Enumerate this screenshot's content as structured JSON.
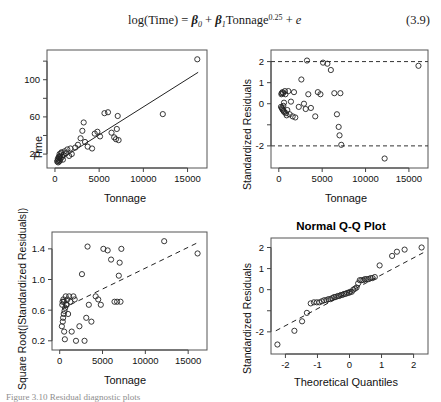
{
  "equation": {
    "number": "(3.9)",
    "text": "log(Time) = β₀ + β₁Tonnage^0.25 + e",
    "lhs": "log(Time) = ",
    "beta0": "β",
    "beta0_sub": "0",
    "plus1": " + ",
    "beta1": "β",
    "beta1_sub": "1",
    "term": "Tonnage",
    "exponent": "0.25",
    "plus2": " + ",
    "error": "e"
  },
  "caption_partial": "Figure 3.10  Residual diagnostic plots",
  "chart_data": [
    {
      "id": "time-vs-tonnage",
      "type": "scatter",
      "title": "",
      "xlabel": "Tonnage",
      "ylabel": "Time",
      "xlim": [
        -900,
        17200
      ],
      "ylim": [
        5,
        132
      ],
      "xticks": [
        0,
        5000,
        10000,
        15000
      ],
      "xticklabels": [
        "0",
        "5000",
        "10000",
        "15000"
      ],
      "yticks": [
        20,
        60,
        100
      ],
      "yticklabels": [
        "20",
        "60",
        "100"
      ],
      "yminorticks": [
        40,
        80,
        120
      ],
      "grid": false,
      "legend": "none",
      "marker": "open-circle",
      "fit_line": {
        "style": "solid",
        "x": [
          380,
          16200
        ],
        "y": [
          13,
          108
        ]
      },
      "points": [
        [
          250,
          12
        ],
        [
          300,
          13
        ],
        [
          330,
          15
        ],
        [
          360,
          11
        ],
        [
          400,
          14
        ],
        [
          430,
          17
        ],
        [
          470,
          12
        ],
        [
          500,
          16
        ],
        [
          520,
          20
        ],
        [
          560,
          13
        ],
        [
          600,
          18
        ],
        [
          640,
          15
        ],
        [
          700,
          21
        ],
        [
          760,
          22
        ],
        [
          820,
          17
        ],
        [
          900,
          14
        ],
        [
          980,
          19
        ],
        [
          1100,
          23
        ],
        [
          1250,
          21
        ],
        [
          1400,
          25
        ],
        [
          1600,
          18
        ],
        [
          1750,
          26
        ],
        [
          1900,
          20
        ],
        [
          2300,
          27
        ],
        [
          2600,
          30
        ],
        [
          2900,
          37
        ],
        [
          3100,
          45
        ],
        [
          3250,
          54
        ],
        [
          3400,
          33
        ],
        [
          3700,
          28
        ],
        [
          4200,
          26
        ],
        [
          4500,
          42
        ],
        [
          4800,
          44
        ],
        [
          5100,
          39
        ],
        [
          5600,
          64
        ],
        [
          6000,
          65
        ],
        [
          6400,
          43
        ],
        [
          6700,
          38
        ],
        [
          6900,
          36
        ],
        [
          7000,
          47
        ],
        [
          7100,
          61
        ],
        [
          7200,
          35
        ],
        [
          12200,
          63
        ],
        [
          16100,
          122
        ]
      ]
    },
    {
      "id": "std-residuals-vs-tonnage",
      "type": "scatter",
      "title": "",
      "xlabel": "Tonnage",
      "ylabel": "Standardized Residuals",
      "xlim": [
        -900,
        17200
      ],
      "ylim": [
        -3.05,
        2.55
      ],
      "xticks": [
        0,
        5000,
        10000,
        15000
      ],
      "xticklabels": [
        "0",
        "5000",
        "10000",
        "15000"
      ],
      "yticks": [
        2,
        1,
        0,
        -1,
        -2
      ],
      "yticklabels": [
        "2",
        "1",
        "0",
        "",
        "-2"
      ],
      "grid": false,
      "legend": "none",
      "marker": "open-circle",
      "href_lines": [
        {
          "y": 2,
          "style": "dashed"
        },
        {
          "y": -2,
          "style": "dashed"
        }
      ],
      "points": [
        [
          250,
          -0.15
        ],
        [
          300,
          0.45
        ],
        [
          330,
          0.5
        ],
        [
          360,
          -0.2
        ],
        [
          400,
          -0.25
        ],
        [
          430,
          0.55
        ],
        [
          470,
          -0.3
        ],
        [
          500,
          0.5
        ],
        [
          520,
          -0.1
        ],
        [
          560,
          -0.35
        ],
        [
          600,
          0.05
        ],
        [
          640,
          -0.4
        ],
        [
          700,
          0.6
        ],
        [
          760,
          0.45
        ],
        [
          820,
          -0.45
        ],
        [
          900,
          -0.55
        ],
        [
          980,
          -0.3
        ],
        [
          1100,
          0.6
        ],
        [
          1250,
          -0.5
        ],
        [
          1400,
          0.1
        ],
        [
          1600,
          -0.6
        ],
        [
          1750,
          0.55
        ],
        [
          1900,
          -0.65
        ],
        [
          2300,
          -0.15
        ],
        [
          2600,
          1.15
        ],
        [
          2900,
          0.0
        ],
        [
          3100,
          -0.25
        ],
        [
          3250,
          2.05
        ],
        [
          3400,
          0.45
        ],
        [
          3700,
          -0.2
        ],
        [
          4200,
          -0.6
        ],
        [
          4500,
          0.55
        ],
        [
          4800,
          0.45
        ],
        [
          5100,
          1.95
        ],
        [
          5600,
          1.9
        ],
        [
          6000,
          1.6
        ],
        [
          6400,
          0.5
        ],
        [
          6700,
          -0.5
        ],
        [
          6900,
          -1.1
        ],
        [
          7000,
          -1.5
        ],
        [
          7100,
          0.5
        ],
        [
          7200,
          -1.95
        ],
        [
          12200,
          -2.6
        ],
        [
          16100,
          1.8
        ]
      ]
    },
    {
      "id": "sqrt-abs-std-residuals-vs-tonnage",
      "type": "scatter",
      "title": "",
      "xlabel": "Tonnage",
      "ylabel": "Square Root(|Standardized Residuals|)",
      "xlim": [
        -900,
        17200
      ],
      "ylim": [
        0.08,
        1.62
      ],
      "xticks": [
        0,
        5000,
        10000,
        15000
      ],
      "xticklabels": [
        "0",
        "5000",
        "10000",
        "15000"
      ],
      "yticks": [
        0.2,
        0.6,
        1.0,
        1.4
      ],
      "yticklabels": [
        "0.2",
        "0.6",
        "1.0",
        "1.4"
      ],
      "grid": false,
      "legend": "none",
      "marker": "open-circle",
      "fit_line": {
        "style": "dashed",
        "x": [
          300,
          16100
        ],
        "y": [
          0.62,
          1.48
        ]
      },
      "points": [
        [
          250,
          0.39
        ],
        [
          300,
          0.67
        ],
        [
          330,
          0.71
        ],
        [
          360,
          0.45
        ],
        [
          400,
          0.5
        ],
        [
          430,
          0.74
        ],
        [
          470,
          0.55
        ],
        [
          500,
          0.71
        ],
        [
          520,
          0.32
        ],
        [
          560,
          0.59
        ],
        [
          600,
          0.22
        ],
        [
          640,
          0.63
        ],
        [
          700,
          0.78
        ],
        [
          760,
          0.67
        ],
        [
          820,
          0.67
        ],
        [
          900,
          0.74
        ],
        [
          980,
          0.55
        ],
        [
          1100,
          0.78
        ],
        [
          1250,
          0.71
        ],
        [
          1400,
          0.32
        ],
        [
          1600,
          0.78
        ],
        [
          1750,
          0.74
        ],
        [
          1900,
          0.2
        ],
        [
          2300,
          0.39
        ],
        [
          2600,
          1.07
        ],
        [
          2900,
          0.2
        ],
        [
          3100,
          0.5
        ],
        [
          3250,
          1.43
        ],
        [
          3400,
          0.67
        ],
        [
          3700,
          0.45
        ],
        [
          4200,
          0.78
        ],
        [
          4500,
          0.74
        ],
        [
          4800,
          0.67
        ],
        [
          5100,
          1.4
        ],
        [
          5600,
          1.38
        ],
        [
          6000,
          1.26
        ],
        [
          6400,
          0.71
        ],
        [
          6700,
          0.71
        ],
        [
          6900,
          1.05
        ],
        [
          7000,
          1.22
        ],
        [
          7100,
          0.71
        ],
        [
          7200,
          1.4
        ],
        [
          12200,
          1.5
        ],
        [
          16100,
          1.34
        ]
      ]
    },
    {
      "id": "normal-qq-plot",
      "type": "scatter",
      "title": "Normal Q-Q Plot",
      "xlabel": "Theoretical Quantiles",
      "ylabel": "Standardized Residuals",
      "xlim": [
        -2.45,
        2.45
      ],
      "ylim": [
        -3.05,
        2.45
      ],
      "xticks": [
        -2,
        -1,
        0,
        1,
        2
      ],
      "xticklabels": [
        "-2",
        "-1",
        "0",
        "1",
        "2"
      ],
      "yticks": [
        2,
        1,
        0,
        -1,
        -2
      ],
      "yticklabels": [
        "2",
        "1",
        "0",
        "",
        "-2"
      ],
      "grid": false,
      "legend": "none",
      "marker": "open-circle",
      "fit_line": {
        "style": "dashed",
        "x": [
          -2.3,
          2.3
        ],
        "y": [
          -1.95,
          1.75
        ]
      },
      "points": [
        [
          -2.25,
          -2.6
        ],
        [
          -1.72,
          -1.95
        ],
        [
          -1.48,
          -1.5
        ],
        [
          -1.33,
          -1.1
        ],
        [
          -1.21,
          -0.65
        ],
        [
          -1.11,
          -0.6
        ],
        [
          -1.02,
          -0.6
        ],
        [
          -0.94,
          -0.6
        ],
        [
          -0.86,
          -0.55
        ],
        [
          -0.79,
          -0.5
        ],
        [
          -0.72,
          -0.5
        ],
        [
          -0.66,
          -0.45
        ],
        [
          -0.6,
          -0.45
        ],
        [
          -0.54,
          -0.4
        ],
        [
          -0.48,
          -0.35
        ],
        [
          -0.43,
          -0.35
        ],
        [
          -0.37,
          -0.3
        ],
        [
          -0.32,
          -0.3
        ],
        [
          -0.27,
          -0.25
        ],
        [
          -0.22,
          -0.25
        ],
        [
          -0.17,
          -0.2
        ],
        [
          -0.12,
          -0.2
        ],
        [
          -0.07,
          -0.15
        ],
        [
          -0.02,
          -0.15
        ],
        [
          0.02,
          -0.1
        ],
        [
          0.07,
          -0.1
        ],
        [
          0.12,
          0.0
        ],
        [
          0.17,
          0.05
        ],
        [
          0.22,
          0.1
        ],
        [
          0.27,
          0.3
        ],
        [
          0.32,
          0.45
        ],
        [
          0.37,
          0.45
        ],
        [
          0.43,
          0.45
        ],
        [
          0.48,
          0.5
        ],
        [
          0.54,
          0.5
        ],
        [
          0.6,
          0.5
        ],
        [
          0.66,
          0.55
        ],
        [
          0.72,
          0.55
        ],
        [
          0.79,
          0.6
        ],
        [
          0.94,
          1.15
        ],
        [
          1.33,
          1.6
        ],
        [
          1.48,
          1.8
        ],
        [
          1.72,
          1.9
        ],
        [
          2.25,
          2.0
        ]
      ]
    }
  ]
}
